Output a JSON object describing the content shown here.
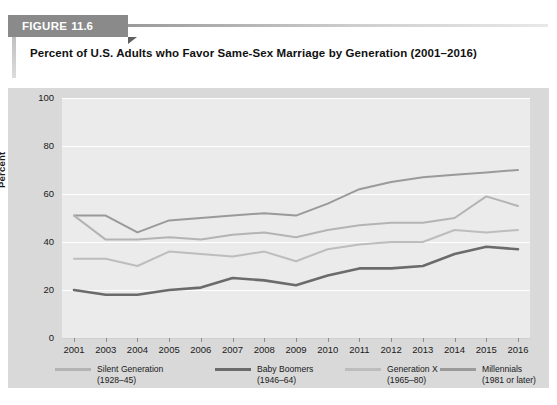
{
  "figure": {
    "label_word": "FIGURE",
    "number": "11.6",
    "title": "Percent of U.S. Adults who Favor Same-Sex Marriage by Generation (2001–2016)"
  },
  "axes": {
    "ylabel": "Percent",
    "yticks": [
      "100",
      "80",
      "60",
      "40",
      "20",
      "0"
    ],
    "xticks": [
      "2001",
      "2003",
      "2004",
      "2005",
      "2006",
      "2007",
      "2008",
      "2009",
      "2010",
      "2011",
      "2012",
      "2013",
      "2014",
      "2015",
      "2016"
    ]
  },
  "legend": {
    "position": "bottom",
    "items": [
      {
        "name": "Silent Generation",
        "years": "(1928–45)",
        "color": "#b4b4b4"
      },
      {
        "name": "Baby Boomers",
        "years": "(1946–64)",
        "color": "#6b6b6b"
      },
      {
        "name": "Generation X",
        "years": "(1965–80)",
        "color": "#bdbdbd"
      },
      {
        "name": "Millennials",
        "years": "(1981 or later)",
        "color": "#9a9a9a"
      }
    ]
  },
  "chart_data": {
    "type": "line",
    "title": "Percent of U.S. Adults who Favor Same-Sex Marriage by Generation (2001–2016)",
    "xlabel": "",
    "ylabel": "Percent",
    "ylim": [
      0,
      100
    ],
    "yticks": [
      0,
      20,
      40,
      60,
      80,
      100
    ],
    "grid": true,
    "legend_position": "bottom",
    "x": [
      "2001",
      "2003",
      "2004",
      "2005",
      "2006",
      "2007",
      "2008",
      "2009",
      "2010",
      "2011",
      "2012",
      "2013",
      "2014",
      "2015",
      "2016"
    ],
    "series": [
      {
        "name": "Millennials",
        "sublabel": "(1981 or later)",
        "color": "#9a9a9a",
        "values": [
          51,
          51,
          44,
          49,
          50,
          51,
          52,
          51,
          56,
          62,
          65,
          67,
          68,
          69,
          70
        ]
      },
      {
        "name": "Silent Generation",
        "sublabel": "(1928–45)",
        "color": "#b4b4b4",
        "values": [
          51,
          41,
          41,
          42,
          41,
          43,
          44,
          42,
          45,
          47,
          48,
          48,
          50,
          59,
          55
        ]
      },
      {
        "name": "Generation X",
        "sublabel": "(1965–80)",
        "color": "#bdbdbd",
        "values": [
          33,
          33,
          30,
          36,
          35,
          34,
          36,
          32,
          37,
          39,
          40,
          40,
          45,
          44,
          45
        ]
      },
      {
        "name": "Baby Boomers",
        "sublabel": "(1946–64)",
        "color": "#6b6b6b",
        "values": [
          20,
          18,
          18,
          20,
          21,
          25,
          24,
          22,
          26,
          29,
          29,
          30,
          35,
          38,
          37
        ]
      }
    ]
  }
}
